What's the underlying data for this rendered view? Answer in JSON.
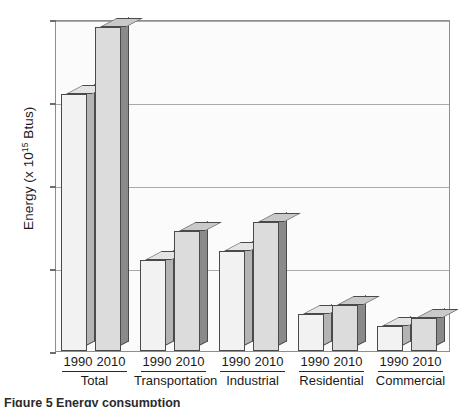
{
  "chart_data": {
    "type": "bar",
    "title": "",
    "xlabel": "",
    "ylabel": "Energy (x 10^15 Btus)",
    "ylabel_prefix": "Energy (x 10",
    "ylabel_exponent": "15",
    "ylabel_suffix": " Btus)",
    "ylim": [
      0,
      80
    ],
    "yticks": [
      0,
      20,
      40,
      60,
      80
    ],
    "ytick_labels": [
      "0",
      "20",
      "40",
      "60",
      "80"
    ],
    "grid": true,
    "legend": "none",
    "categories": [
      "Total",
      "Transportation",
      "Industrial",
      "Residential",
      "Commercial"
    ],
    "series": [
      {
        "name": "1990",
        "values": [
          62,
          22,
          24,
          9,
          6
        ]
      },
      {
        "name": "2010",
        "values": [
          78,
          29,
          31,
          11,
          8
        ]
      }
    ],
    "style": "3d-bar",
    "colors": {
      "bar_1990_front": "#f2f2f2",
      "bar_1990_side": "#b4b4b4",
      "bar_2010_front": "#dcdcdc",
      "bar_2010_side": "#8a8a8a",
      "outline": "#4a4a4a",
      "plot_background": "#fbfbfb",
      "gridline": "#a9a9a9",
      "frame": "#8e8e8e"
    }
  },
  "caption": "Figure 5 Energy consumption",
  "groups": [
    {
      "name": "Total",
      "year1": "1990",
      "year2": "2010"
    },
    {
      "name": "Transportation",
      "year1": "1990",
      "year2": "2010"
    },
    {
      "name": "Industrial",
      "year1": "1990",
      "year2": "2010"
    },
    {
      "name": "Residential",
      "year1": "1990",
      "year2": "2010"
    },
    {
      "name": "Commercial",
      "year1": "1990",
      "year2": "2010"
    }
  ]
}
